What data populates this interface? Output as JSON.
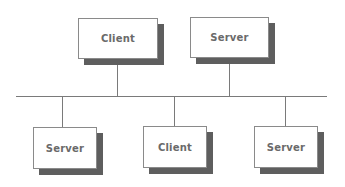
{
  "diagram": {
    "type": "bus-network",
    "bus": {
      "y": 96,
      "x1": 16,
      "x2": 327
    },
    "colors": {
      "line": "#7a7a7a",
      "shadow": "#5e5e5e",
      "box_border": "#8a8a8a",
      "text": "#6a6a6a"
    },
    "nodes": [
      {
        "label": "Client",
        "position": "top",
        "x": 78,
        "y": 18,
        "w": 80,
        "h": 41,
        "connector_x": 117
      },
      {
        "label": "Server",
        "position": "top",
        "x": 190,
        "y": 17,
        "w": 79,
        "h": 41,
        "connector_x": 229
      },
      {
        "label": "Server",
        "position": "bottom",
        "x": 33,
        "y": 127,
        "w": 64,
        "h": 42,
        "connector_x": 62
      },
      {
        "label": "Client",
        "position": "bottom",
        "x": 143,
        "y": 126,
        "w": 64,
        "h": 42,
        "connector_x": 174
      },
      {
        "label": "Server",
        "position": "bottom",
        "x": 254,
        "y": 126,
        "w": 64,
        "h": 42,
        "connector_x": 285
      }
    ]
  }
}
